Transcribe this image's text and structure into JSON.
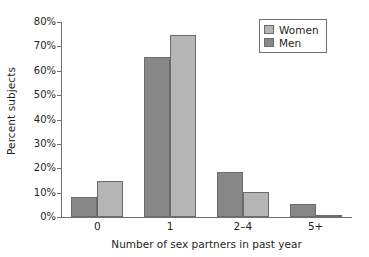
{
  "chart_data": {
    "type": "bar",
    "title": "",
    "subtitle": "",
    "xlabel": "Number of sex partners in past year",
    "ylabel": "Percent subjects",
    "categories": [
      "0",
      "1",
      "2–4",
      "5+"
    ],
    "series": [
      {
        "name": "Men",
        "color": "#878787",
        "values": [
          8.3,
          65.8,
          18.3,
          5.5
        ]
      },
      {
        "name": "Women",
        "color": "#b5b5b5",
        "values": [
          14.8,
          74.7,
          10.3,
          1.0
        ]
      }
    ],
    "ylim": [
      0,
      80
    ],
    "ytick_values": [
      0,
      10,
      20,
      30,
      40,
      50,
      60,
      70,
      80
    ],
    "ytick_labels": [
      "0%",
      "10%",
      "20%",
      "30%",
      "40%",
      "50%",
      "60%",
      "70%",
      "80%"
    ],
    "grid": false,
    "legend_position": "top-right",
    "legend_entries": [
      "Women",
      "Men"
    ],
    "axis_color": "#6f6f6f",
    "bar_edge_color": "#6b6b6b",
    "background": "#ffffff"
  },
  "legend": {
    "women_label": "Women",
    "men_label": "Men"
  },
  "axes": {
    "y_title": "Percent subjects",
    "x_title": "Number of sex partners in past year"
  }
}
